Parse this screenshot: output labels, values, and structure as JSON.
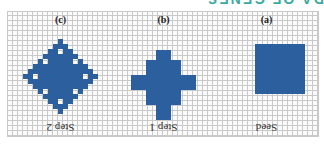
{
  "header": {
    "text": "DA OF GENES"
  },
  "figure": {
    "rotation_deg": 180,
    "fill_color": "#2c5f9e",
    "grid_color": "#c9c9c9",
    "panels": [
      {
        "id": "a",
        "tag": "(a)",
        "caption": "Seed",
        "shape": "square"
      },
      {
        "id": "b",
        "tag": "(b)",
        "caption": "Step 1",
        "shape": "cross"
      },
      {
        "id": "c",
        "tag": "(c)",
        "caption": "Step 2",
        "shape": "diamond-with-holes"
      }
    ]
  }
}
